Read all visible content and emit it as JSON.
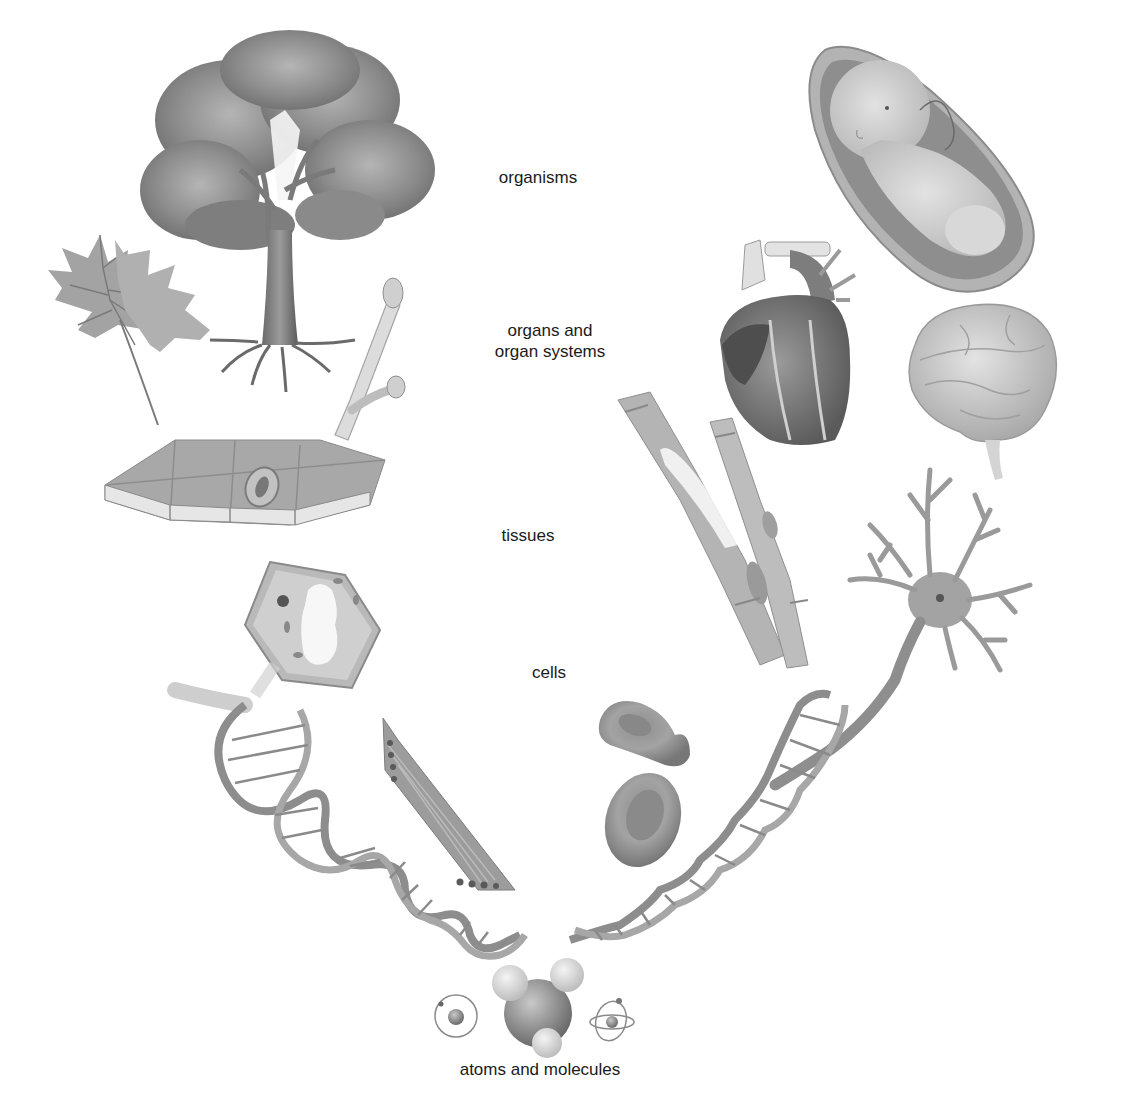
{
  "diagram": {
    "topic": "Levels of biological organization",
    "labels": {
      "organisms": "organisms",
      "organs_line1": "organs and",
      "organs_line2": "organ systems",
      "tissues": "tissues",
      "cells": "cells",
      "atoms": "atoms and molecules"
    },
    "left_branch": {
      "organisms": [
        "tree"
      ],
      "organs": [
        "leaf",
        "twig-with-buds"
      ],
      "tissues": [
        "plant-epidermal-tissue"
      ],
      "cells": [
        "plant-cell"
      ],
      "molecules": [
        "dna-helix"
      ]
    },
    "right_branch": {
      "organisms": [
        "human-fetus"
      ],
      "organs": [
        "heart",
        "brain"
      ],
      "tissues": [
        "muscle-tissue"
      ],
      "cells": [
        "muscle-cell",
        "red-blood-cells",
        "neuron"
      ],
      "molecules": [
        "dna-helix"
      ]
    },
    "bottom": {
      "items": [
        "atom",
        "water-molecule",
        "atom-with-orbits"
      ]
    },
    "colors": {
      "background": "#ffffff",
      "illustration_gray": "#8a8a8a",
      "text": "#1a1a1a"
    }
  }
}
